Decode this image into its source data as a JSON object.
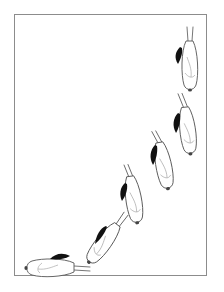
{
  "illustration": {
    "description": "Sequence of six white rodent figures with black shapes arranged along an upward curve inside a framed panel",
    "frame_color": "#8c8c8c",
    "background": "#ffffff",
    "figure_count": 6,
    "figures": [
      {
        "index": 1,
        "orientation": "vertical, head down",
        "position": "top-right"
      },
      {
        "index": 2,
        "orientation": "vertical, head down",
        "position": "upper-right"
      },
      {
        "index": 3,
        "orientation": "slightly tilted, head down",
        "position": "middle-right"
      },
      {
        "index": 4,
        "orientation": "slightly tilted, head down",
        "position": "center"
      },
      {
        "index": 5,
        "orientation": "diagonal, head lower-left",
        "position": "lower-center"
      },
      {
        "index": 6,
        "orientation": "horizontal, head left",
        "position": "bottom-left"
      }
    ]
  }
}
